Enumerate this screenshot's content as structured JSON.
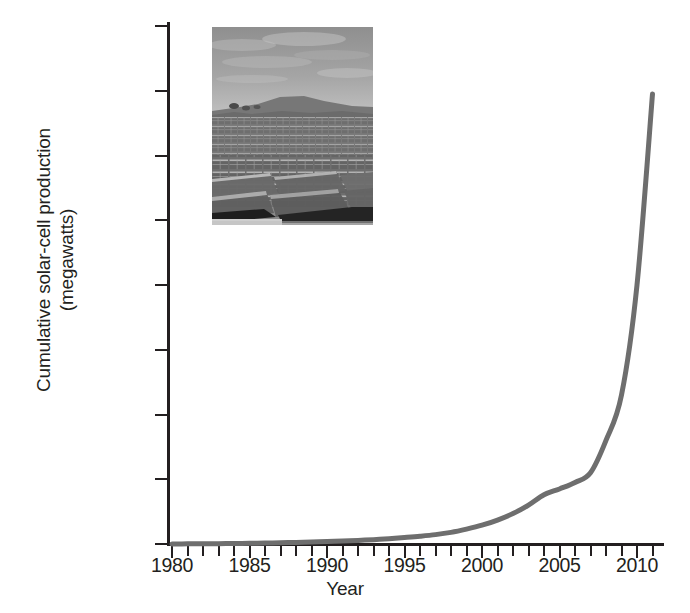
{
  "chart_data": {
    "type": "line",
    "title": "",
    "xlabel": "Year",
    "ylabel": "Cumulative solar-cell production (megawatts)",
    "ylabel_lines": [
      "Cumulative solar-cell production",
      "(megawatts)"
    ],
    "xlim": [
      1980,
      2011
    ],
    "ylim": [
      0,
      80000
    ],
    "grid": false,
    "legend": "none",
    "line_color": "#6e6e6e",
    "x_tick_labels": [
      "1980",
      "1985",
      "1990",
      "1995",
      "2000",
      "2005",
      "2010"
    ],
    "x_tick_values": [
      1980,
      1985,
      1990,
      1995,
      2000,
      2005,
      2010
    ],
    "x_minor_tick_interval": 1,
    "y_tick_labels": [
      "0",
      "10,000",
      "20,000",
      "30,000",
      "40,000",
      "50,000",
      "60,000",
      "70,000",
      "80,000"
    ],
    "y_tick_values": [
      0,
      10000,
      20000,
      30000,
      40000,
      50000,
      60000,
      70000,
      80000
    ],
    "x": [
      1980,
      1981,
      1982,
      1983,
      1984,
      1985,
      1986,
      1987,
      1988,
      1989,
      1990,
      1991,
      1992,
      1993,
      1994,
      1995,
      1996,
      1997,
      1998,
      1999,
      2000,
      2001,
      2002,
      2003,
      2004,
      2005,
      2006,
      2007,
      2008,
      2009,
      2010,
      2011
    ],
    "values": [
      10,
      20,
      35,
      55,
      80,
      110,
      150,
      190,
      240,
      300,
      370,
      450,
      550,
      670,
      820,
      1000,
      1200,
      1450,
      1800,
      2300,
      2900,
      3700,
      4700,
      6000,
      7600,
      8500,
      9500,
      11000,
      16000,
      23000,
      40000,
      69500
    ],
    "series": [
      {
        "name": "Cumulative solar-cell production",
        "units": "megawatts",
        "values": [
          10,
          20,
          35,
          55,
          80,
          110,
          150,
          190,
          240,
          300,
          370,
          450,
          550,
          670,
          820,
          1000,
          1200,
          1450,
          1800,
          2300,
          2900,
          3700,
          4700,
          6000,
          7600,
          8500,
          9500,
          11000,
          16000,
          23000,
          40000,
          69500
        ]
      }
    ],
    "annotations": []
  },
  "inset": {
    "name": "solar-panel-farm-photo",
    "description": "Black and white photograph of a large solar panel farm under a cloudy sky"
  }
}
